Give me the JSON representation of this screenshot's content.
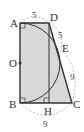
{
  "diagram": {
    "points": {
      "A": "A",
      "B": "B",
      "C": "C",
      "D": "D",
      "E": "E",
      "H": "H",
      "O": "O"
    },
    "lengths": {
      "AD": "5",
      "DE": "5",
      "EC": "9",
      "BC": "9"
    },
    "colors": {
      "fill": "#d9d9d9",
      "stroke": "#333333",
      "dashed": "#999999"
    }
  }
}
